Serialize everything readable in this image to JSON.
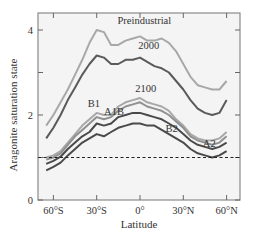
{
  "chart_data": {
    "type": "line",
    "title": "",
    "xlabel": "Latitude",
    "ylabel": "Aragonite saturation state",
    "xlim": [
      -70,
      68
    ],
    "ylim": [
      0,
      4.4
    ],
    "x_ticks": [
      -60,
      -30,
      0,
      30,
      60
    ],
    "x_tick_labels": [
      "60°S",
      "30°S",
      "0°",
      "30°N",
      "60°N"
    ],
    "y_ticks": [
      0,
      2,
      4
    ],
    "y_tick_labels": [
      "0",
      "2",
      "4"
    ],
    "grid": false,
    "reference_line": {
      "y": 1,
      "style": "dashed"
    },
    "x": [
      -65,
      -60,
      -55,
      -50,
      -45,
      -40,
      -35,
      -30,
      -25,
      -20,
      -15,
      -10,
      -5,
      0,
      5,
      10,
      15,
      20,
      25,
      30,
      35,
      40,
      45,
      50,
      55,
      60
    ],
    "series": [
      {
        "name": "Preindustrial",
        "color": "#a8a8a8",
        "values": [
          1.75,
          2.0,
          2.3,
          2.6,
          2.95,
          3.3,
          3.7,
          4.0,
          3.95,
          3.65,
          3.65,
          3.75,
          3.8,
          3.85,
          3.75,
          3.75,
          3.8,
          3.7,
          3.5,
          3.2,
          2.9,
          2.7,
          2.65,
          2.6,
          2.6,
          2.8
        ]
      },
      {
        "name": "2000",
        "color": "#5a5a5a",
        "values": [
          1.45,
          1.7,
          2.0,
          2.35,
          2.65,
          2.95,
          3.2,
          3.4,
          3.35,
          3.2,
          3.2,
          3.3,
          3.3,
          3.35,
          3.25,
          3.15,
          3.1,
          3.0,
          2.8,
          2.6,
          2.35,
          2.15,
          2.05,
          2.0,
          2.05,
          2.35
        ]
      },
      {
        "name": "B1",
        "color": "#a8a8a8",
        "values": [
          1.0,
          1.05,
          1.15,
          1.35,
          1.55,
          1.75,
          1.9,
          2.05,
          2.0,
          2.0,
          2.2,
          2.3,
          2.35,
          2.4,
          2.3,
          2.25,
          2.2,
          2.1,
          1.9,
          1.75,
          1.55,
          1.45,
          1.4,
          1.4,
          1.45,
          1.6
        ]
      },
      {
        "name": "A1B",
        "color": "#909090",
        "values": [
          0.95,
          1.0,
          1.1,
          1.3,
          1.5,
          1.65,
          1.8,
          1.95,
          1.9,
          1.95,
          2.1,
          2.2,
          2.25,
          2.3,
          2.2,
          2.15,
          2.1,
          2.0,
          1.85,
          1.7,
          1.5,
          1.4,
          1.35,
          1.3,
          1.35,
          1.5
        ]
      },
      {
        "name": "B2",
        "color": "#4a4a4a",
        "values": [
          0.85,
          0.92,
          1.02,
          1.2,
          1.35,
          1.5,
          1.6,
          1.8,
          1.75,
          1.8,
          1.95,
          2.0,
          2.05,
          2.05,
          2.0,
          1.95,
          1.9,
          1.8,
          1.7,
          1.55,
          1.4,
          1.3,
          1.25,
          1.2,
          1.25,
          1.35
        ]
      },
      {
        "name": "A2",
        "color": "#4a4a4a",
        "values": [
          0.7,
          0.78,
          0.88,
          1.05,
          1.2,
          1.35,
          1.45,
          1.55,
          1.5,
          1.6,
          1.7,
          1.75,
          1.8,
          1.8,
          1.75,
          1.75,
          1.65,
          1.55,
          1.45,
          1.35,
          1.2,
          1.1,
          1.05,
          1.0,
          1.05,
          1.15
        ]
      }
    ],
    "annotations": [
      {
        "text": "Preindustrial",
        "x": 3,
        "y": 4.15
      },
      {
        "text": "2000",
        "x": 6,
        "y": 3.55
      },
      {
        "text": "2100",
        "x": 4,
        "y": 2.55
      },
      {
        "text": "B1",
        "x": -32,
        "y": 2.2
      },
      {
        "text": "A1B",
        "x": -18,
        "y": 2.0
      },
      {
        "text": "B2",
        "x": 22,
        "y": 1.6
      },
      {
        "text": "A2",
        "x": 48,
        "y": 1.25
      }
    ]
  }
}
